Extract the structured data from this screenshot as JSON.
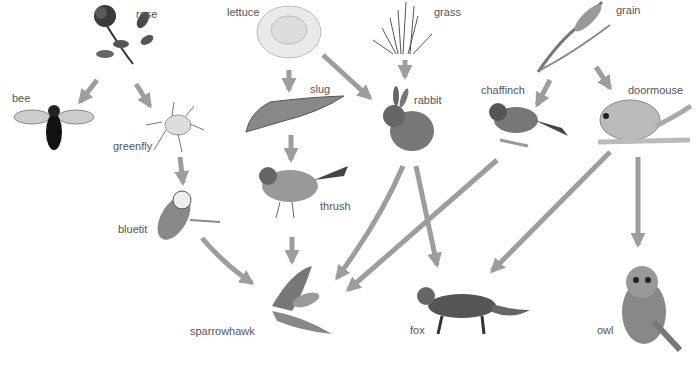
{
  "diagram": {
    "arrow_color": "#9d9d9d",
    "organisms": [
      {
        "id": "rose",
        "label": "rose",
        "kind": "producer"
      },
      {
        "id": "lettuce",
        "label": "lettuce",
        "kind": "producer"
      },
      {
        "id": "grass",
        "label": "grass",
        "kind": "producer"
      },
      {
        "id": "grain",
        "label": "grain",
        "kind": "producer"
      },
      {
        "id": "bee",
        "label": "bee",
        "kind": "consumer"
      },
      {
        "id": "greenfly",
        "label": "greenfly",
        "kind": "consumer"
      },
      {
        "id": "slug",
        "label": "slug",
        "kind": "consumer"
      },
      {
        "id": "rabbit",
        "label": "rabbit",
        "kind": "consumer"
      },
      {
        "id": "chaffinch",
        "label": "chaffinch",
        "kind": "consumer"
      },
      {
        "id": "doormouse",
        "label": "doormouse",
        "kind": "consumer"
      },
      {
        "id": "bluetit",
        "label": "bluetit",
        "kind": "consumer"
      },
      {
        "id": "thrush",
        "label": "thrush",
        "kind": "consumer"
      },
      {
        "id": "sparrowhawk",
        "label": "sparrowhawk",
        "kind": "predator"
      },
      {
        "id": "fox",
        "label": "fox",
        "kind": "predator"
      },
      {
        "id": "owl",
        "label": "owl",
        "kind": "predator"
      }
    ],
    "links": [
      {
        "from": "rose",
        "to": "bee"
      },
      {
        "from": "rose",
        "to": "greenfly"
      },
      {
        "from": "greenfly",
        "to": "bluetit"
      },
      {
        "from": "bluetit",
        "to": "sparrowhawk"
      },
      {
        "from": "lettuce",
        "to": "slug"
      },
      {
        "from": "lettuce",
        "to": "rabbit"
      },
      {
        "from": "grass",
        "to": "rabbit"
      },
      {
        "from": "slug",
        "to": "thrush"
      },
      {
        "from": "thrush",
        "to": "sparrowhawk"
      },
      {
        "from": "rabbit",
        "to": "sparrowhawk"
      },
      {
        "from": "rabbit",
        "to": "fox"
      },
      {
        "from": "grain",
        "to": "chaffinch"
      },
      {
        "from": "grain",
        "to": "doormouse"
      },
      {
        "from": "chaffinch",
        "to": "sparrowhawk"
      },
      {
        "from": "doormouse",
        "to": "fox"
      },
      {
        "from": "doormouse",
        "to": "owl"
      }
    ]
  }
}
